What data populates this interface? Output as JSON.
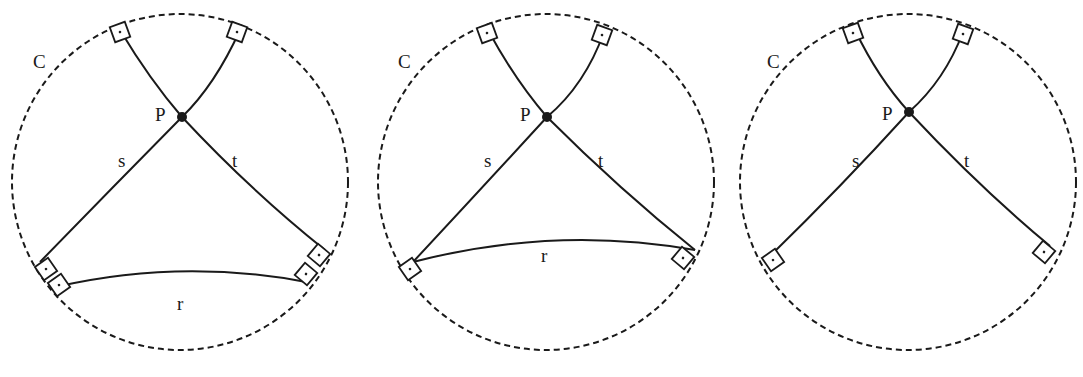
{
  "figure": {
    "panels": [
      {
        "circle_label": "C",
        "point_label": "P",
        "line_labels": {
          "s": "s",
          "t": "t",
          "r": "r"
        },
        "has_r": true
      },
      {
        "circle_label": "C",
        "point_label": "P",
        "line_labels": {
          "s": "s",
          "t": "t",
          "r": "r"
        },
        "has_r": true
      },
      {
        "circle_label": "C",
        "point_label": "P",
        "line_labels": {
          "s": "s",
          "t": "t"
        },
        "has_r": false
      }
    ],
    "colors": {
      "stroke": "#1a1a1a",
      "background": "#ffffff"
    }
  }
}
